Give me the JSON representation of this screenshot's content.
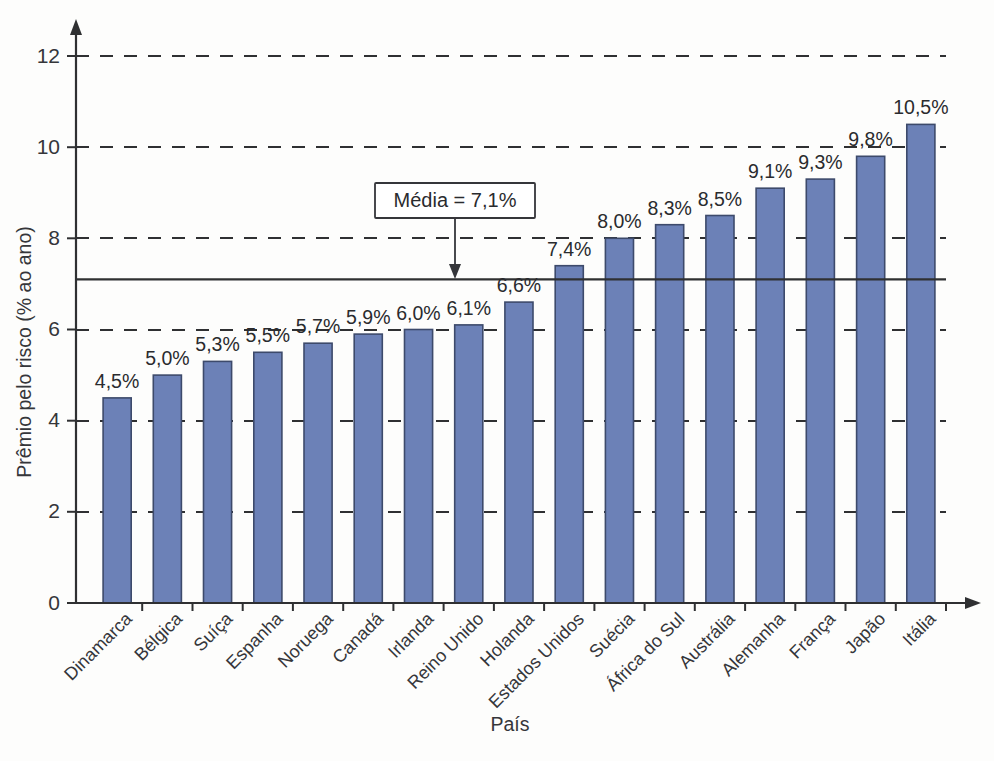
{
  "chart_data": {
    "type": "bar",
    "title": "",
    "xlabel": "País",
    "ylabel": "Prêmio pelo risco (% ao ano)",
    "ylim": [
      0,
      12.6
    ],
    "yticks": [
      0,
      2,
      4,
      6,
      8,
      10,
      12
    ],
    "ytick_labels": [
      "0",
      "2",
      "4",
      "6",
      "8",
      "10",
      "12"
    ],
    "grid": "horizontal dashed at 2,4,6,8,10,12",
    "legend": "none",
    "categories": [
      "Dinamarca",
      "Bélgica",
      "Suíça",
      "Espanha",
      "Noruega",
      "Canadá",
      "Irlanda",
      "Reino Unido",
      "Holanda",
      "Estados Unidos",
      "Suécia",
      "África do Sul",
      "Austrália",
      "Alemanha",
      "França",
      "Japão",
      "Itália"
    ],
    "values": [
      4.5,
      5.0,
      5.3,
      5.5,
      5.7,
      5.9,
      6.0,
      6.1,
      6.6,
      7.4,
      8.0,
      8.3,
      8.5,
      9.1,
      9.3,
      9.8,
      10.5
    ],
    "value_labels": [
      "4,5%",
      "5,0%",
      "5,3%",
      "5,5%",
      "5,7%",
      "5,9%",
      "6,0%",
      "6,1%",
      "6,6%",
      "7,4%",
      "8,0%",
      "8,3%",
      "8,5%",
      "9,1%",
      "9,3%",
      "9,8%",
      "10,5%"
    ],
    "bar_color": "#6c81b7",
    "bar_edge_color": "#3d4a6b",
    "annotations": [
      {
        "name": "mean-reference",
        "label": "Média = 7,1%",
        "value": 7.1,
        "kind": "horizontal-reference-line-with-callout"
      }
    ]
  },
  "axes": {
    "y_title": "Prêmio pelo risco (% ao ano)",
    "x_title": "País"
  },
  "annotation": {
    "mean_label": "Média = 7,1%"
  }
}
